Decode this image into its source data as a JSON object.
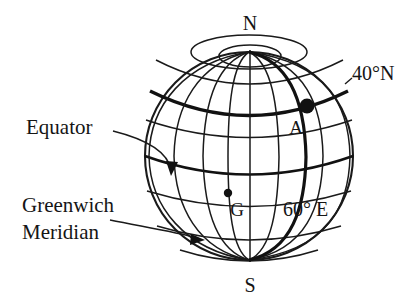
{
  "diagram": {
    "background_color": "#ffffff",
    "line_color": "#1a1a1a",
    "labels": {
      "north_pole": "N",
      "south_pole": "S",
      "point_a": "A",
      "point_g": "G",
      "latitude_40n": "40°N",
      "longitude_60e": "60° E",
      "equator": "Equator",
      "greenwich_meridian_line1": "Greenwich",
      "greenwich_meridian_line2": "Meridian"
    },
    "features": {
      "globe_outline": "circle",
      "highlighted_parallel": "40°N",
      "highlighted_meridian": "60° E",
      "marked_points": [
        "A",
        "G"
      ],
      "annotation_arrows": [
        "Equator",
        "Greenwich Meridian"
      ]
    }
  }
}
